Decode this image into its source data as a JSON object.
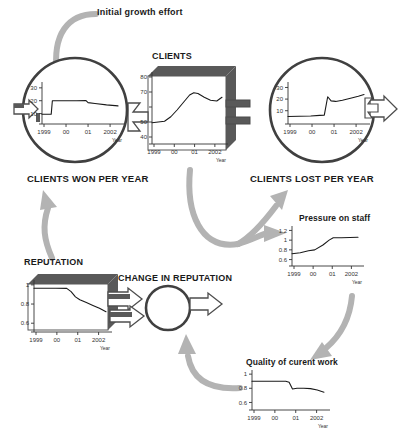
{
  "diagram": {
    "title_annotation": "Initial growth effort",
    "colors": {
      "ink": "#262626",
      "stock_fill": "#ffffff",
      "stock_shadow": "#595959",
      "arrow_gray": "#b3b3b3",
      "pipe_outline": "#4d4d4d",
      "axis": "#333333"
    },
    "nodes": [
      {
        "id": "clients-won",
        "label": "CLIENTS WON PER YEAR",
        "shape": "circle-valve"
      },
      {
        "id": "clients",
        "label": "CLIENTS",
        "shape": "stock-box"
      },
      {
        "id": "clients-lost",
        "label": "CLIENTS LOST PER YEAR",
        "shape": "circle-valve"
      },
      {
        "id": "reputation",
        "label": "REPUTATION",
        "shape": "stock-box"
      },
      {
        "id": "change-rep",
        "label": "CHANGE IN REPUTATION",
        "shape": "circle-valve"
      },
      {
        "id": "pressure",
        "label": "Pressure on staff",
        "shape": "plain-chart"
      },
      {
        "id": "quality",
        "label": "Quality of curent work",
        "shape": "plain-chart"
      }
    ],
    "connectors": [
      {
        "from": "initial-growth-effort",
        "to": "clients-won",
        "style": "curved-gray-arrow"
      },
      {
        "from": "reputation",
        "to": "clients-won",
        "style": "curved-gray-arrow"
      },
      {
        "from": "clients",
        "to": "clients-lost",
        "style": "curved-gray-arrow"
      },
      {
        "from": "clients",
        "to": "pressure",
        "style": "curved-gray-arrow"
      },
      {
        "from": "pressure",
        "to": "quality",
        "style": "curved-gray-arrow"
      },
      {
        "from": "quality",
        "to": "change-rep",
        "style": "curved-gray-arrow"
      }
    ]
  },
  "chart_data": [
    {
      "id": "clients-won",
      "type": "line",
      "title": "CLIENTS WON PER YEAR",
      "xlabel": "Year",
      "ylabel": "",
      "ylim": [
        5,
        33
      ],
      "yticks": [
        10,
        20,
        30
      ],
      "xticks": [
        "1999",
        "00",
        "01",
        "2002"
      ],
      "x": [
        1999.0,
        1999.2,
        1999.4,
        1999.45,
        1999.6,
        2000.0,
        2000.5,
        2000.9,
        2001.0,
        2001.3,
        2001.8,
        2002.3
      ],
      "values": [
        9.5,
        9.5,
        9.5,
        20.0,
        20.0,
        20.0,
        20.0,
        20.2,
        18.5,
        17.8,
        16.8,
        16.0
      ]
    },
    {
      "id": "clients",
      "type": "line",
      "title": "CLIENTS",
      "xlabel": "Year",
      "ylabel": "",
      "ylim": [
        38,
        82
      ],
      "yticks": [
        40,
        50,
        60,
        70,
        80
      ],
      "yticks_visible": [
        40,
        50,
        70,
        80
      ],
      "xticks": [
        "1999",
        "00",
        "01",
        "2002"
      ],
      "x": [
        1999.0,
        1999.3,
        1999.6,
        1999.9,
        2000.2,
        2000.5,
        2000.8,
        2001.0,
        2001.2,
        2001.5,
        2001.8,
        2002.1,
        2002.35
      ],
      "values": [
        49.5,
        50.0,
        50.5,
        53.5,
        58.0,
        63.0,
        68.0,
        69.5,
        69.0,
        66.5,
        64.5,
        64.0,
        66.5
      ]
    },
    {
      "id": "clients-lost",
      "type": "line",
      "title": "CLIENTS LOST PER YEAR",
      "xlabel": "Year",
      "ylabel": "",
      "ylim": [
        2,
        33
      ],
      "yticks": [
        10,
        20,
        30
      ],
      "xticks": [
        "1999",
        "00",
        "01",
        "2002"
      ],
      "x": [
        1999.0,
        1999.5,
        2000.0,
        2000.4,
        2000.6,
        2000.75,
        2000.9,
        2001.1,
        2001.4,
        2001.8,
        2002.1,
        2002.35
      ],
      "values": [
        5.0,
        5.2,
        5.5,
        6.0,
        6.2,
        22.0,
        18.5,
        18.0,
        19.0,
        21.0,
        22.5,
        24.0
      ]
    },
    {
      "id": "reputation",
      "type": "line",
      "title": "REPUTATION",
      "xlabel": "Year",
      "ylabel": "",
      "ylim": [
        0.55,
        1.03
      ],
      "yticks": [
        0.6,
        0.8,
        1.0
      ],
      "xticks": [
        "1999",
        "00",
        "01",
        "2002"
      ],
      "x": [
        1999.0,
        1999.5,
        2000.0,
        2000.5,
        2000.7,
        2000.9,
        2001.1,
        2001.4,
        2001.7,
        2002.0,
        2002.3
      ],
      "values": [
        0.965,
        0.965,
        0.965,
        0.963,
        0.93,
        0.875,
        0.845,
        0.815,
        0.785,
        0.755,
        0.72
      ]
    },
    {
      "id": "pressure",
      "type": "line",
      "title": "Pressure on staff",
      "xlabel": "Year",
      "ylabel": "",
      "ylim": [
        0.55,
        1.25
      ],
      "yticks": [
        0.6,
        0.8,
        1.0,
        1.2
      ],
      "xticks": [
        "1999",
        "00",
        "01",
        "2002"
      ],
      "x": [
        1999.0,
        1999.4,
        1999.8,
        2000.1,
        2000.5,
        2000.8,
        2001.0,
        2001.4,
        2001.8,
        2002.2
      ],
      "values": [
        0.72,
        0.74,
        0.78,
        0.8,
        0.9,
        1.0,
        1.05,
        1.05,
        1.055,
        1.06
      ]
    },
    {
      "id": "quality",
      "type": "line",
      "title": "Quality of curent work",
      "xlabel": "Year",
      "ylabel": "",
      "ylim": [
        0.55,
        1.03
      ],
      "yticks": [
        0.6,
        0.8,
        1.0
      ],
      "xticks": [
        "1999",
        "00",
        "01",
        "2002"
      ],
      "x": [
        1999.0,
        1999.5,
        2000.0,
        2000.5,
        2000.65,
        2000.8,
        2001.0,
        2001.3,
        2001.6,
        2001.9,
        2002.2
      ],
      "values": [
        0.9,
        0.9,
        0.9,
        0.9,
        0.885,
        0.79,
        0.8,
        0.8,
        0.795,
        0.775,
        0.745
      ]
    }
  ],
  "axis_labels": {
    "year_word": "Year",
    "years": [
      "1999",
      "00",
      "01",
      "2002"
    ]
  }
}
